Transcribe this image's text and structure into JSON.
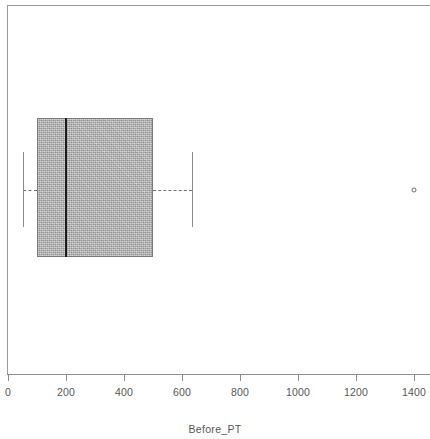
{
  "chart_data": {
    "type": "box",
    "title": "",
    "xlabel": "Before_PT",
    "ylabel": "",
    "orientation": "horizontal",
    "xlim": [
      0,
      1450
    ],
    "grid": false,
    "legend": null,
    "xticks": [
      {
        "value": 0,
        "label": "0"
      },
      {
        "value": 200,
        "label": "200"
      },
      {
        "value": 400,
        "label": "400"
      },
      {
        "value": 600,
        "label": "600"
      },
      {
        "value": 800,
        "label": "800"
      },
      {
        "value": 1000,
        "label": "1000"
      },
      {
        "value": 1200,
        "label": "1200"
      },
      {
        "value": 1400,
        "label": "1400"
      }
    ],
    "boxes": [
      {
        "name": "Before_PT",
        "whisker_low": 50,
        "q1": 100,
        "median": 200,
        "q3": 500,
        "whisker_high": 635,
        "outliers": [
          1400
        ]
      }
    ],
    "colors": {
      "box_fill": "#a8a8a8",
      "box_edge": "#7b7b7b",
      "median": "#1d1d1d",
      "whisker": "#707070",
      "outlier": "#6f6f6f",
      "axis": "#8d8d8d",
      "text": "#555555",
      "background": "#ffffff"
    }
  },
  "axis_title": "Before_PT"
}
